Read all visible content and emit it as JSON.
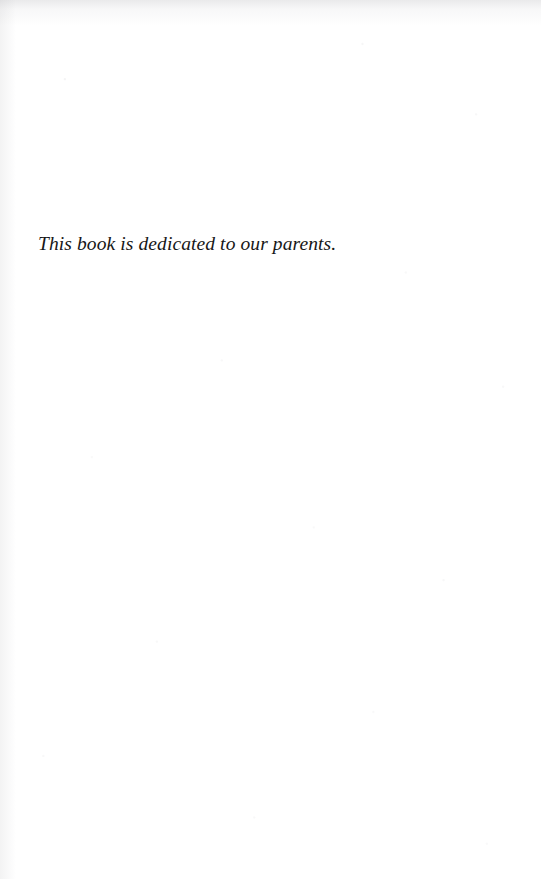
{
  "page": {
    "kind": "book-dedication-page",
    "width": 541,
    "height": 879,
    "background_color": "#ffffff",
    "text_color": "#171717"
  },
  "dedication": {
    "text": "This book is dedicated to our parents."
  }
}
